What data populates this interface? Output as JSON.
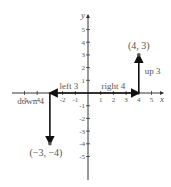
{
  "axes": {
    "x_label": "x",
    "y_label": "y",
    "x_ticks": [
      {
        "v": -5,
        "label": "-5"
      },
      {
        "v": -4,
        "label": "-4"
      },
      {
        "v": -2,
        "label": "-2"
      },
      {
        "v": -1,
        "label": "-1"
      },
      {
        "v": 1,
        "label": "1"
      },
      {
        "v": 2,
        "label": "2"
      },
      {
        "v": 3,
        "label": "3"
      },
      {
        "v": 4,
        "label": "4"
      },
      {
        "v": 5,
        "label": "5"
      }
    ],
    "y_ticks": [
      {
        "v": 5,
        "label": "5"
      },
      {
        "v": 4,
        "label": "4"
      },
      {
        "v": 3,
        "label": "3"
      },
      {
        "v": 2,
        "label": "2"
      },
      {
        "v": 1,
        "label": "1"
      },
      {
        "v": -1,
        "label": "-1"
      },
      {
        "v": -2,
        "label": "-2"
      },
      {
        "v": -3,
        "label": "-3"
      },
      {
        "v": -4,
        "label": "-4"
      },
      {
        "v": -5,
        "label": "-5"
      }
    ],
    "x_range": [
      -6,
      6
    ],
    "y_range": [
      -6,
      6
    ]
  },
  "points": [
    {
      "x": 4,
      "y": 3,
      "label": "(4, 3)"
    },
    {
      "x": -3,
      "y": -4,
      "label": "(−3, −4)"
    }
  ],
  "moves": [
    {
      "from": [
        0,
        0
      ],
      "to": [
        4,
        0
      ],
      "label": "right 4"
    },
    {
      "from": [
        4,
        0
      ],
      "to": [
        4,
        3
      ],
      "label": "up 3"
    },
    {
      "from": [
        0,
        0
      ],
      "to": [
        -3,
        0
      ],
      "label": "left 3"
    },
    {
      "from": [
        -3,
        0
      ],
      "to": [
        -3,
        -4
      ],
      "label": "down 4"
    }
  ]
}
